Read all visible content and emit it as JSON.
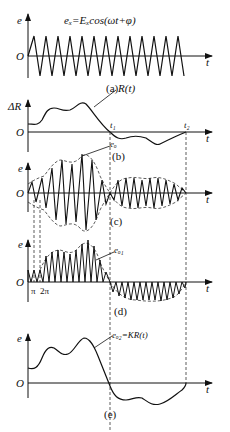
{
  "panels": {
    "a": {
      "caption": "(a)",
      "y_label": "e",
      "x_label": "t",
      "origin_label": "O",
      "formula": "eₓ=Eₓcos(ωt+φ)"
    },
    "b": {
      "caption": "(b)",
      "y_label": "ΔR",
      "x_label": "t",
      "origin_label": "O",
      "curve_label": "R(t)",
      "t1_label": "t₁",
      "t2_label": "t₂"
    },
    "c": {
      "caption": "(c)",
      "y_label": "e",
      "x_label": "t",
      "origin_label": "O",
      "curve_label": "eₒ"
    },
    "d": {
      "caption": "(d)",
      "y_label": "e",
      "x_label": "t",
      "origin_label": "O",
      "curve_label": "eₒ₁",
      "tick_pi": "π",
      "tick_2pi": "2π"
    },
    "e": {
      "caption": "(e)",
      "y_label": "e",
      "x_label": "t",
      "origin_label": "O",
      "curve_label": "eₒ₂=KR(t)"
    }
  },
  "colors": {
    "stroke": "#111111",
    "background": "#ffffff"
  }
}
